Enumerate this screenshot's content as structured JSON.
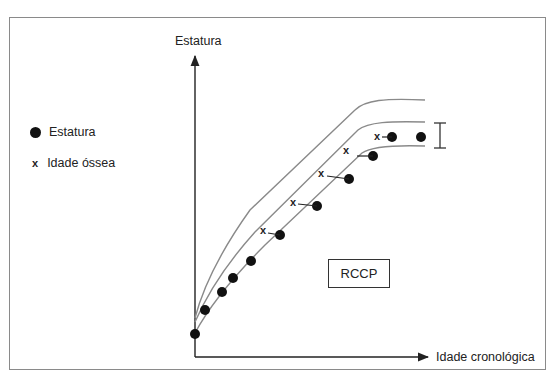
{
  "diagram": {
    "y_axis_label": "Estatura",
    "x_axis_label": "Idade cronológica",
    "box_label": "RCCP",
    "legend": [
      {
        "icon": "filled-circle",
        "label": "Estatura"
      },
      {
        "icon": "x-mark",
        "label": "Idade óssea"
      }
    ],
    "curves": [
      "upper-percentile",
      "middle-percentile",
      "lower-percentile"
    ],
    "bracket": "target-height-range",
    "colors": {
      "curve": "#8a8a8a",
      "points": "#111111",
      "axis": "#222222"
    }
  }
}
